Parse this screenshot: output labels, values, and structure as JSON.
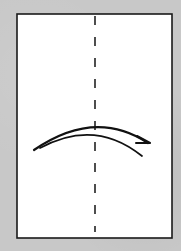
{
  "diagram": {
    "type": "origami-fold-instruction",
    "description": "Fold in half vertically: valley fold along center dashed line, folding left side over to right",
    "background_color": "#c8c8c8",
    "paper": {
      "color": "#ffffff",
      "stroke": "#1a1a1a",
      "x": 17,
      "y": 14,
      "width": 155,
      "height": 224
    },
    "fold_line": {
      "style": "dashed",
      "kind": "valley-fold",
      "x": 95,
      "y_start": 16,
      "y_end": 232,
      "color": "#222222"
    },
    "arrow": {
      "direction": "left-to-right",
      "kind": "fold-over-arrow",
      "color": "#111111"
    }
  }
}
